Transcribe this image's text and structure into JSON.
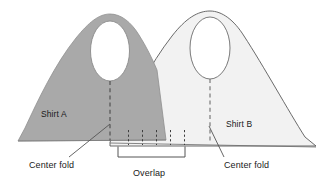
{
  "diagram": {
    "background_color": "#ffffff",
    "width": 322,
    "height": 187,
    "labels": {
      "shirt_a": "Shirt A",
      "shirt_b": "Shirt B",
      "center_fold_left": "Center fold",
      "center_fold_right": "Center fold",
      "overlap": "Overlap"
    },
    "colors": {
      "shirt_a_fill": "#a9a9a9",
      "shirt_a_stroke": "#8f8f8f",
      "shirt_b_fill": "#f2f2f2",
      "shirt_b_stroke": "#5a5a5a",
      "neck_hole_fill": "#ffffff",
      "line": "#444444",
      "text": "#1a1a1a",
      "background": "#ffffff"
    },
    "shapes": {
      "shirt_a": {
        "name": "Shirt A",
        "fill": "#a9a9a9",
        "path": "M 18,141 L 24,128 C 38,98 56,62 77,36 C 88,22 98,14 110,14 C 122,14 131,22 139,34 C 146,44 151,55 155,65 L 165,139 Z",
        "neck": {
          "cx": 110,
          "cy": 50,
          "rx": 20,
          "ry": 31
        },
        "center_fold": {
          "x": 110,
          "y1": 82,
          "y2": 140
        }
      },
      "shirt_b": {
        "name": "Shirt B",
        "fill": "#f2f2f2",
        "path": "M 110,142 L 118,128 C 133,98 152,60 175,33 C 188,18 199,11 210,11 C 222,11 233,20 243,35 C 262,63 288,110 305,137 L 315,145 Z",
        "neck": {
          "cx": 210,
          "cy": 47,
          "rx": 20,
          "ry": 31
        },
        "center_fold": {
          "x": 210,
          "y1": 79,
          "y2": 141
        }
      }
    },
    "pins": {
      "name": "overlap pin marks",
      "count": 5,
      "x_positions": [
        128,
        142,
        156,
        170,
        184
      ],
      "y_top": 130,
      "y_bottom": 146
    },
    "overlap_bracket": {
      "x1": 118,
      "x2": 185,
      "y": 153,
      "tick_height": 6
    },
    "leaders": {
      "center_fold_left": {
        "x1": 70,
        "y1": 158,
        "x2": 108,
        "y2": 126
      },
      "center_fold_right": {
        "x1": 222,
        "y1": 158,
        "x2": 208,
        "y2": 128
      }
    }
  }
}
